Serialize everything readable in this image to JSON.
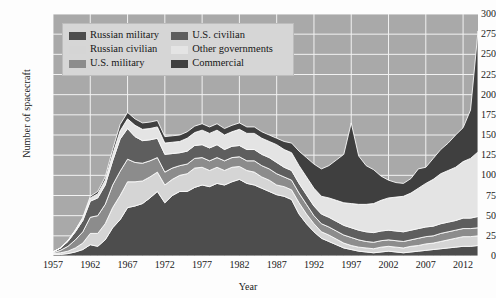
{
  "chart_data": {
    "type": "area",
    "stacked": true,
    "title": "",
    "xlabel": "Year",
    "ylabel": "Number of spacecraft",
    "xlim": [
      1957,
      2014
    ],
    "ylim": [
      0,
      300
    ],
    "ytick_step": 25,
    "yticks": [
      0,
      25,
      50,
      75,
      100,
      125,
      150,
      175,
      200,
      225,
      250,
      275,
      300
    ],
    "xticks": [
      1957,
      1962,
      1967,
      1972,
      1977,
      1982,
      1987,
      1992,
      1997,
      2002,
      2007,
      2012
    ],
    "grid": true,
    "legend_position": "top-left",
    "plot_background": "#a9a9a9",
    "grid_color": "#f2f2f2",
    "x": [
      1957,
      1958,
      1959,
      1960,
      1961,
      1962,
      1963,
      1964,
      1965,
      1966,
      1967,
      1968,
      1969,
      1970,
      1971,
      1972,
      1973,
      1974,
      1975,
      1976,
      1977,
      1978,
      1979,
      1980,
      1981,
      1982,
      1983,
      1984,
      1985,
      1986,
      1987,
      1988,
      1989,
      1990,
      1991,
      1992,
      1993,
      1994,
      1995,
      1996,
      1997,
      1998,
      1999,
      2000,
      2001,
      2002,
      2003,
      2004,
      2005,
      2006,
      2007,
      2008,
      2009,
      2010,
      2011,
      2012,
      2013,
      2014
    ],
    "series": [
      {
        "name": "Russian military",
        "color": "#4d4d4d",
        "values": [
          2,
          2,
          3,
          5,
          8,
          14,
          12,
          20,
          35,
          45,
          60,
          62,
          65,
          72,
          80,
          66,
          75,
          80,
          80,
          85,
          88,
          86,
          90,
          88,
          92,
          95,
          90,
          88,
          84,
          80,
          76,
          74,
          70,
          52,
          40,
          30,
          22,
          18,
          14,
          10,
          8,
          6,
          5,
          4,
          5,
          6,
          5,
          4,
          5,
          6,
          7,
          8,
          9,
          10,
          11,
          12,
          12,
          13
        ]
      },
      {
        "name": "Russian civilian",
        "color": "#d5d5d5",
        "values": [
          1,
          2,
          3,
          5,
          8,
          14,
          16,
          20,
          25,
          30,
          32,
          30,
          28,
          26,
          24,
          22,
          20,
          20,
          22,
          24,
          22,
          20,
          20,
          18,
          18,
          16,
          16,
          16,
          14,
          14,
          12,
          12,
          12,
          14,
          12,
          10,
          8,
          8,
          7,
          6,
          5,
          5,
          5,
          5,
          6,
          6,
          6,
          6,
          7,
          7,
          8,
          8,
          9,
          10,
          11,
          12,
          12,
          12
        ]
      },
      {
        "name": "U.S. military",
        "color": "#8c8c8c",
        "values": [
          1,
          3,
          6,
          10,
          14,
          20,
          22,
          24,
          28,
          30,
          28,
          24,
          22,
          20,
          18,
          16,
          14,
          12,
          12,
          12,
          12,
          12,
          12,
          12,
          12,
          12,
          12,
          14,
          14,
          14,
          14,
          12,
          12,
          12,
          12,
          10,
          10,
          10,
          10,
          10,
          10,
          9,
          8,
          8,
          8,
          8,
          8,
          8,
          8,
          9,
          9,
          9,
          10,
          10,
          10,
          10,
          10,
          10
        ]
      },
      {
        "name": "U.S. civilian",
        "color": "#5e5e5e",
        "values": [
          1,
          3,
          6,
          10,
          14,
          20,
          22,
          24,
          30,
          40,
          38,
          32,
          28,
          26,
          24,
          22,
          18,
          16,
          16,
          16,
          16,
          16,
          16,
          14,
          14,
          14,
          14,
          14,
          14,
          14,
          14,
          12,
          12,
          12,
          12,
          12,
          12,
          12,
          12,
          12,
          12,
          12,
          12,
          12,
          12,
          12,
          12,
          12,
          12,
          12,
          12,
          12,
          12,
          12,
          12,
          13,
          13,
          14
        ]
      },
      {
        "name": "Other governments",
        "color": "#e4e4e4",
        "values": [
          0,
          0,
          1,
          2,
          3,
          4,
          5,
          6,
          8,
          10,
          12,
          14,
          14,
          14,
          14,
          14,
          14,
          14,
          16,
          16,
          18,
          18,
          18,
          18,
          18,
          20,
          20,
          20,
          20,
          20,
          22,
          22,
          22,
          22,
          22,
          22,
          22,
          24,
          26,
          28,
          30,
          32,
          34,
          36,
          38,
          40,
          42,
          44,
          46,
          50,
          54,
          58,
          62,
          64,
          66,
          70,
          74,
          80
        ]
      },
      {
        "name": "Commercial",
        "color": "#3f3f3f",
        "values": [
          0,
          0,
          0,
          0,
          1,
          2,
          3,
          4,
          6,
          8,
          8,
          8,
          8,
          8,
          8,
          8,
          8,
          8,
          8,
          8,
          8,
          8,
          8,
          8,
          8,
          8,
          8,
          8,
          8,
          8,
          8,
          10,
          12,
          18,
          24,
          30,
          34,
          40,
          50,
          60,
          100,
          60,
          48,
          42,
          30,
          22,
          18,
          16,
          18,
          24,
          20,
          26,
          30,
          34,
          40,
          42,
          60,
          150
        ]
      }
    ]
  },
  "legend": {
    "entries": [
      {
        "label": "Russian military",
        "color": "#4d4d4d"
      },
      {
        "label": "U.S. civilian",
        "color": "#5e5e5e"
      },
      {
        "label": "Russian civilian",
        "color": "#d5d5d5"
      },
      {
        "label": "Other governments",
        "color": "#e4e4e4"
      },
      {
        "label": "U.S. military",
        "color": "#8c8c8c"
      },
      {
        "label": "Commercial",
        "color": "#3f3f3f"
      }
    ]
  }
}
